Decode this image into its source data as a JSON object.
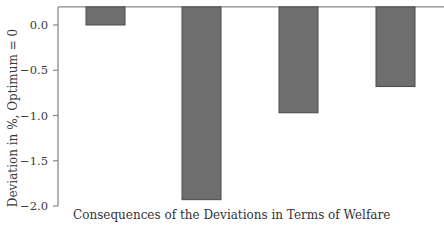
{
  "chart_data": {
    "type": "bar",
    "title": "",
    "xlabel": "Consequences of the Deviations in Terms of Welfare",
    "ylabel": "Deviation in %, Optimum = 0",
    "categories": [
      "1",
      "2",
      "3",
      "4"
    ],
    "category_labels_visible": false,
    "values": [
      0.0,
      -1.93,
      -0.97,
      -0.68
    ],
    "bar_baseline": 0.2,
    "ylim": [
      -2.0,
      0.2
    ],
    "yticks": [
      0.0,
      -0.5,
      -1.0,
      -1.5,
      -2.0
    ],
    "ytick_labels": [
      "0.0",
      "−0.5",
      "−1.0",
      "−1.5",
      "−2.0"
    ],
    "grid": false,
    "legend": null,
    "bar_color": "#6e6e6e",
    "bar_edge_color": "#4a4a4a",
    "axis_color": "#888888"
  },
  "labels": {
    "xlabel": "Consequences of the Deviations in Terms of Welfare",
    "ylabel": "Deviation in %, Optimum = 0"
  }
}
